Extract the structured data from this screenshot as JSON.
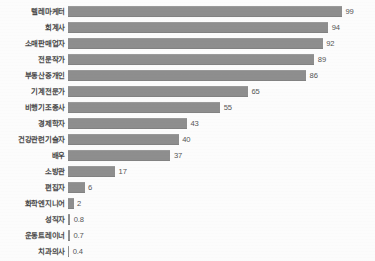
{
  "chart_data": {
    "type": "bar",
    "orientation": "horizontal",
    "title": "",
    "subtitle": "",
    "xlabel": "",
    "ylabel": "",
    "grid": false,
    "legend": null,
    "legend_position": "none",
    "xlim": [
      0,
      99
    ],
    "axis_ticks_visible": false,
    "bar_color": "#8e8e8e",
    "background_color": "#fcfcfc",
    "label_color": "#4a4a4a",
    "value_color": "#555555",
    "sorted": "descending",
    "categories": [
      "텔레마케터",
      "회계사",
      "소매판매업자",
      "전문작가",
      "부동산중개인",
      "기계전문가",
      "비행기조종사",
      "경제학자",
      "건강관련기술자",
      "배우",
      "소방관",
      "편집자",
      "화학엔지니어",
      "성직자",
      "운동트레이너",
      "치과의사"
    ],
    "values": [
      99,
      94,
      92,
      89,
      86,
      65,
      55,
      43,
      40,
      37,
      17,
      6,
      2,
      0.8,
      0.7,
      0.4
    ],
    "value_labels": [
      "99",
      "94",
      "92",
      "89",
      "86",
      "65",
      "55",
      "43",
      "40",
      "37",
      "17",
      "6",
      "2",
      "0.8",
      "0.7",
      "0.4"
    ],
    "rows": [
      {
        "label": "텔레마케터",
        "value": 99,
        "value_label": "99"
      },
      {
        "label": "회계사",
        "value": 94,
        "value_label": "94"
      },
      {
        "label": "소매판매업자",
        "value": 92,
        "value_label": "92"
      },
      {
        "label": "전문작가",
        "value": 89,
        "value_label": "89"
      },
      {
        "label": "부동산중개인",
        "value": 86,
        "value_label": "86"
      },
      {
        "label": "기계전문가",
        "value": 65,
        "value_label": "65"
      },
      {
        "label": "비행기조종사",
        "value": 55,
        "value_label": "55"
      },
      {
        "label": "경제학자",
        "value": 43,
        "value_label": "43"
      },
      {
        "label": "건강관련기술자",
        "value": 40,
        "value_label": "40"
      },
      {
        "label": "배우",
        "value": 37,
        "value_label": "37"
      },
      {
        "label": "소방관",
        "value": 17,
        "value_label": "17"
      },
      {
        "label": "편집자",
        "value": 6,
        "value_label": "6"
      },
      {
        "label": "화학엔지니어",
        "value": 2,
        "value_label": "2"
      },
      {
        "label": "성직자",
        "value": 0.8,
        "value_label": "0.8"
      },
      {
        "label": "운동트레이너",
        "value": 0.7,
        "value_label": "0.7"
      },
      {
        "label": "치과의사",
        "value": 0.4,
        "value_label": "0.4"
      }
    ]
  }
}
